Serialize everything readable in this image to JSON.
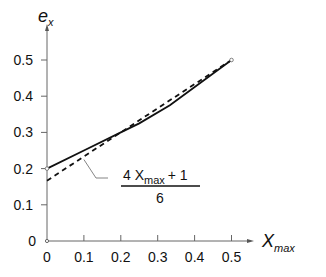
{
  "chart_data": {
    "type": "line",
    "title": "",
    "xlabel": "X_max",
    "ylabel": "e_x",
    "xlabel_main": "X",
    "xlabel_sub": "max",
    "ylabel_main": "e",
    "ylabel_sub": "x",
    "xlim": [
      0,
      0.55
    ],
    "ylim": [
      0,
      0.55
    ],
    "grid": false,
    "x_ticks": [
      "0",
      "0.1",
      "0.2",
      "0.3",
      "0.4",
      "0.5"
    ],
    "y_ticks": [
      "0",
      "0.1",
      "0.2",
      "0.3",
      "0.4",
      "0.5"
    ],
    "series": [
      {
        "name": "e_x (exact)",
        "style": "solid",
        "x": [
          0,
          0.1,
          0.2,
          0.25,
          0.333,
          0.5
        ],
        "y": [
          0.2,
          0.25,
          0.3,
          0.325,
          0.375,
          0.5
        ]
      },
      {
        "name": "(4 X_max + 1) / 6",
        "style": "dashed",
        "x": [
          0,
          0.5
        ],
        "y": [
          0.1667,
          0.5
        ]
      }
    ],
    "annotation": {
      "numerator_lead": "4 X",
      "numerator_sub": "max",
      "numerator_tail": "+ 1",
      "denominator": "6",
      "points_to_x": 0.1,
      "points_to_y": 0.2333
    }
  }
}
